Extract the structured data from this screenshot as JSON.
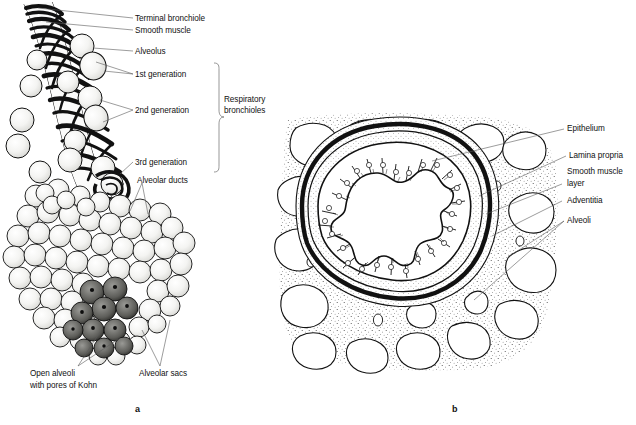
{
  "figure": {
    "panels": [
      {
        "letter": "a",
        "name": "respiratory-bronchiole-tree"
      },
      {
        "letter": "b",
        "name": "bronchiole-cross-section"
      }
    ]
  },
  "panel_a": {
    "letter": "a",
    "labels": [
      {
        "id": "terminal-bronchiole",
        "text": "Terminal bronchiole",
        "x": 135,
        "y": 15
      },
      {
        "id": "smooth-muscle",
        "text": "Smooth muscle",
        "x": 135,
        "y": 27
      },
      {
        "id": "alveolus",
        "text": "Alveolus",
        "x": 135,
        "y": 48
      },
      {
        "id": "first-generation",
        "text": "1st generation",
        "x": 135,
        "y": 71
      },
      {
        "id": "second-generation",
        "text": "2nd generation",
        "x": 135,
        "y": 107
      },
      {
        "id": "third-generation",
        "text": "3rd generation",
        "x": 135,
        "y": 159
      },
      {
        "id": "alveolar-ducts",
        "text": "Alveolar ducts",
        "x": 137,
        "y": 177
      },
      {
        "id": "open-alveoli-line1",
        "text": "Open alveoli",
        "x": 30,
        "y": 371
      },
      {
        "id": "open-alveoli-line2",
        "text": "with pores of Kohn",
        "x": 30,
        "y": 382
      },
      {
        "id": "alveolar-sacs",
        "text": "Alveolar sacs",
        "x": 139,
        "y": 371
      }
    ],
    "bracket": {
      "id": "respiratory-bronchioles-bracket",
      "line1": "Respiratory",
      "line2": "bronchioles",
      "text_x": 224,
      "text_y": 96,
      "top": 63,
      "bottom": 172,
      "x": 214
    }
  },
  "panel_b": {
    "letter": "b",
    "labels": [
      {
        "id": "epithelium",
        "text": "Epithelium",
        "x": 567,
        "y": 126
      },
      {
        "id": "lamina-propria",
        "text": "Lamina propria",
        "x": 569,
        "y": 153
      },
      {
        "id": "smooth-muscle-l1",
        "text": "Smooth muscle",
        "x": 567,
        "y": 169
      },
      {
        "id": "smooth-muscle-l2",
        "text": "layer",
        "x": 567,
        "y": 181
      },
      {
        "id": "adventitia",
        "text": "Adventitia",
        "x": 567,
        "y": 198
      },
      {
        "id": "alveoli",
        "text": "Alveoli",
        "x": 567,
        "y": 218
      }
    ]
  },
  "colors": {
    "ink": "#111111",
    "leader": "#5a5a5a",
    "background": "#ffffff",
    "stipple": "#2b2b2b"
  }
}
